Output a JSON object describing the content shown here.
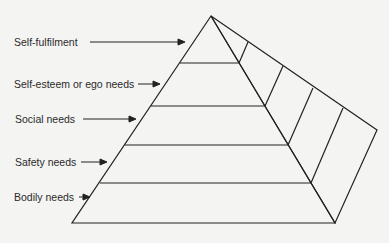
{
  "diagram": {
    "type": "pyramid",
    "colors": {
      "background": "#f4f4f2",
      "line": "#222222",
      "text": "#2a2a2a"
    },
    "levels": [
      {
        "label": "Self-fulfilment",
        "order": 5
      },
      {
        "label": "Self-esteem or ego needs",
        "order": 4
      },
      {
        "label": "Social needs",
        "order": 3
      },
      {
        "label": "Safety needs",
        "order": 2
      },
      {
        "label": "Bodily needs",
        "order": 1
      }
    ]
  }
}
